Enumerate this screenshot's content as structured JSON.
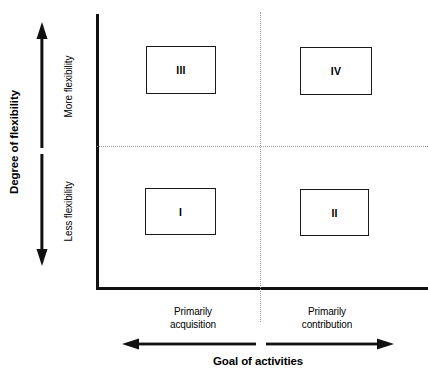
{
  "figure": {
    "type": "2x2-quadrant-matrix",
    "background_color": "#ffffff",
    "line_color": "#111111",
    "divider_color": "#9a9a9a"
  },
  "y_axis": {
    "title": "Degree of flexibility",
    "arrow": "double-headed-vertical",
    "high_label": "More flexibility",
    "low_label": "Less flexibility"
  },
  "x_axis": {
    "title": "Goal of activities",
    "left_arrow": "arrow-left",
    "right_arrow": "arrow-right",
    "left_label": "Primarily\nacquisition",
    "left_label_line1": "Primarily",
    "left_label_line2": "acquisition",
    "right_label_line1": "Primarily",
    "right_label_line2": "contribution"
  },
  "quadrants": [
    {
      "id": "quadrant-i",
      "label": "I",
      "position": "bottom-left",
      "flexibility": "Less flexibility",
      "goal": "Primarily acquisition"
    },
    {
      "id": "quadrant-ii",
      "label": "II",
      "position": "bottom-right",
      "flexibility": "Less flexibility",
      "goal": "Primarily contribution"
    },
    {
      "id": "quadrant-iii",
      "label": "III",
      "position": "top-left",
      "flexibility": "More flexibility",
      "goal": "Primarily acquisition"
    },
    {
      "id": "quadrant-iv",
      "label": "IV",
      "position": "top-right",
      "flexibility": "More flexibility",
      "goal": "Primarily contribution"
    }
  ]
}
